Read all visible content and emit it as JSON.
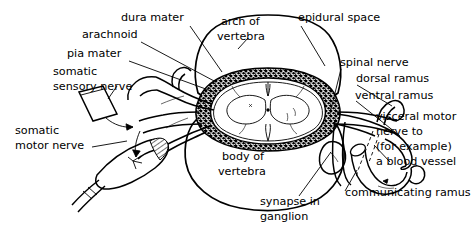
{
  "figure": {
    "background_color": "#ffffff",
    "ink_color": "#000000",
    "width": 476,
    "height": 233
  },
  "labels": {
    "dura_mater": "dura mater",
    "arachnoid": "arachnoid",
    "pia_mater": "pia mater",
    "somatic_sensory_nerve_line1": "somatic",
    "somatic_sensory_nerve_line2": "sensory nerve",
    "somatic_motor_nerve_line1": "somatic",
    "somatic_motor_nerve_line2": "motor nerve",
    "arch_of_vertebra_line1": "arch of",
    "arch_of_vertebra_line2": "vertebra",
    "epidural_space": "epidural space",
    "spinal_nerve": "spinal nerve",
    "dorsal_ramus": "dorsal ramus",
    "ventral_ramus": "ventral ramus",
    "visceral_motor_line1": "visceral motor",
    "visceral_motor_line2": "nerve to",
    "visceral_motor_line3": "(for example)",
    "visceral_motor_line4": "a blood vessel",
    "body_of_vertebra_line1": "body of",
    "body_of_vertebra_line2": "vertebra",
    "synapse_in_ganglion_line1": "synapse in",
    "synapse_in_ganglion_line2": "ganglion",
    "communicating_ramus": "communicating ramus"
  },
  "structures": {
    "vertebral_arch": "arch-of-vertebra",
    "vertebral_body": "body-of-vertebra",
    "spinal_cord": "spinal-cord",
    "gray_matter": "gray-matter-butterfly",
    "epidural_fat": "epidural-space-layer",
    "dorsal_root_ganglion": "dorsal-root-ganglion",
    "sympathetic_ganglion": "sympathetic-ganglion",
    "blood_vessel": "blood-vessel",
    "skin_patch": "skin-patch",
    "muscle_spindle": "muscle"
  }
}
